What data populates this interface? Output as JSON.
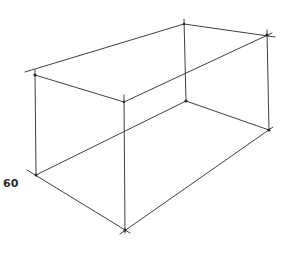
{
  "diagram": {
    "title": "",
    "type": "wireframe-rectangular-prism",
    "stroke_color": "#2a2a2a",
    "label": "60",
    "vertices": {
      "top_left": [
        35,
        75
      ],
      "top_back": [
        184,
        24
      ],
      "top_right": [
        267,
        35
      ],
      "top_front": [
        124,
        102
      ],
      "bottom_left": [
        36,
        175
      ],
      "bottom_back": [
        186,
        101
      ],
      "bottom_right": [
        269,
        130
      ],
      "bottom_front": [
        125,
        230
      ]
    }
  }
}
